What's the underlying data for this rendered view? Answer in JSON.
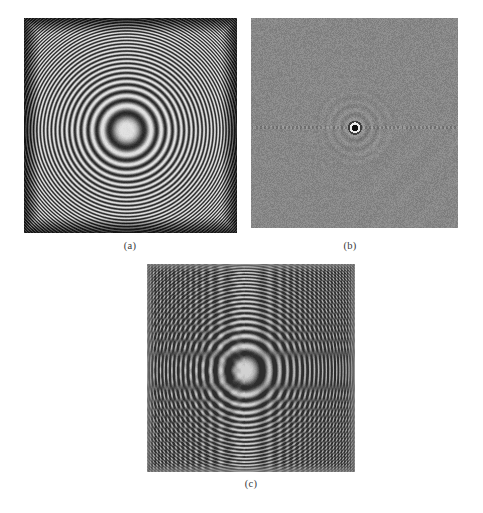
{
  "figure": {
    "background_color": "#ffffff",
    "caption_color": "#3a3a3a",
    "panels": [
      {
        "id": "a",
        "label": "(a)",
        "name": "zone-plate-chirp-image",
        "description": "2-D chirp (zone plate) pattern with concentric rings, darkening toward the border",
        "base_gray": "#8e8e8e",
        "ring_center_x_pct": 48,
        "ring_center_y_pct": 52,
        "x": 24,
        "y": 18,
        "width": 213,
        "height": 215
      },
      {
        "id": "b",
        "label": "(b)",
        "name": "fourier-spectrum-image",
        "description": "Noisy mid-gray Fourier spectrum with a dark central dot and a faint horizontal dotted line through the centre",
        "base_gray": "#8d8d8d",
        "center_dot_x_pct": 50,
        "center_dot_y_pct": 52,
        "x": 251,
        "y": 18,
        "width": 207,
        "height": 210
      },
      {
        "id": "c",
        "label": "(c)",
        "name": "aliased-resampled-image",
        "description": "Aliased re-sampling of the chirp showing a strong vertical ridge and curved moire fringes",
        "base_gray": "#8d8d8d",
        "focus_x_pct": 47,
        "focus_y_pct": 51,
        "x": 147,
        "y": 264,
        "width": 208,
        "height": 208
      }
    ]
  },
  "chart_data": {
    "type": "heatmap",
    "title": "",
    "xlabel": "",
    "ylabel": "",
    "panels": [
      {
        "label": "(a)",
        "kind": "zone-plate",
        "formula": "I(x,y) = 0.5 + 0.5*cos(k*(x^2 + y^2))",
        "chirp_rate_k": 0.0105,
        "center": [
          0.48,
          0.52
        ],
        "gray_range": [
          20,
          225
        ],
        "grid": false
      },
      {
        "label": "(b)",
        "kind": "fourier-spectrum",
        "center": [
          0.5,
          0.52
        ],
        "dc_dot_radius_px": 4,
        "horizontal_streak": true,
        "gray_range": [
          105,
          165
        ],
        "grid": false
      },
      {
        "label": "(c)",
        "kind": "aliased-resample",
        "ridge_x": 0.47,
        "focus": [
          0.47,
          0.51
        ],
        "gray_range": [
          45,
          210
        ],
        "grid": false
      }
    ],
    "legend_position": "none"
  }
}
